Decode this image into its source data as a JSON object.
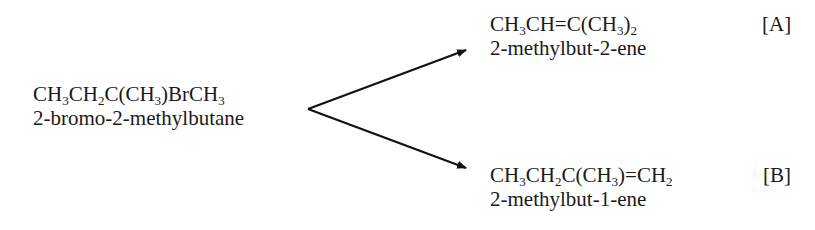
{
  "reactant": {
    "formula_parts": [
      "CH",
      "3",
      "CH",
      "2",
      "C(CH",
      "3",
      ")BrCH",
      "3"
    ],
    "name": "2-bromo-2-methylbutane"
  },
  "products": [
    {
      "label": "[A]",
      "formula_parts": [
        "CH",
        "3",
        "CH=C(CH",
        "3",
        ")",
        "2"
      ],
      "name": "2-methylbut-2-ene"
    },
    {
      "label": "[B]",
      "formula_parts": [
        "CH",
        "3",
        "CH",
        "2",
        "C(CH",
        "3",
        ")=CH",
        "2"
      ],
      "name": "2-methylbut-1-ene"
    }
  ],
  "arrows": {
    "origin": [
      308,
      109
    ],
    "to_A": [
      466,
      50
    ],
    "to_B": [
      466,
      168
    ],
    "color": "#111111"
  }
}
